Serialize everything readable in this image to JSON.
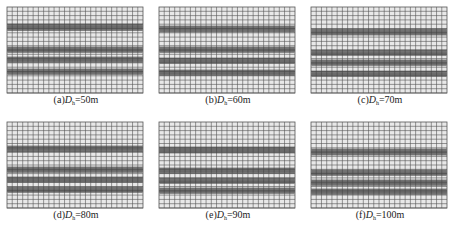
{
  "figure": {
    "panels": [
      {
        "id": "a",
        "prefix": "(a)",
        "var": "D",
        "sub": "h",
        "value": "=50m",
        "bands": [
          [
            17,
            24
          ],
          [
            40,
            46
          ],
          [
            50,
            56
          ],
          [
            62,
            68
          ]
        ]
      },
      {
        "id": "b",
        "prefix": "(b)",
        "var": "D",
        "sub": "h",
        "value": "=60m",
        "bands": [
          [
            19,
            25
          ],
          [
            40,
            46
          ],
          [
            51,
            57
          ],
          [
            63,
            69
          ]
        ]
      },
      {
        "id": "c",
        "prefix": "(c)",
        "var": "D",
        "sub": "h",
        "value": "=70m",
        "bands": [
          [
            22,
            28
          ],
          [
            43,
            49
          ],
          [
            53,
            59
          ],
          [
            64,
            70
          ]
        ]
      },
      {
        "id": "d",
        "prefix": "(d)",
        "var": "D",
        "sub": "h",
        "value": "=80m",
        "bands": [
          [
            24,
            30
          ],
          [
            45,
            51
          ],
          [
            55,
            61
          ],
          [
            65,
            71
          ]
        ]
      },
      {
        "id": "e",
        "prefix": "(e)",
        "var": "D",
        "sub": "h",
        "value": "=90m",
        "bands": [
          [
            25,
            31
          ],
          [
            46,
            52
          ],
          [
            56,
            62
          ],
          [
            66,
            72
          ]
        ]
      },
      {
        "id": "f",
        "prefix": "(f)",
        "var": "D",
        "sub": "h",
        "value": "=100m",
        "bands": [
          [
            27,
            33
          ],
          [
            48,
            54
          ],
          [
            58,
            64
          ],
          [
            67,
            73
          ]
        ]
      }
    ],
    "grid": {
      "width": 136,
      "height": 86,
      "cols": 26,
      "row_spacing": 4.3,
      "line_color": "#555555",
      "cell_fill": "#e8e8e8",
      "dense_color": "#333333"
    }
  }
}
